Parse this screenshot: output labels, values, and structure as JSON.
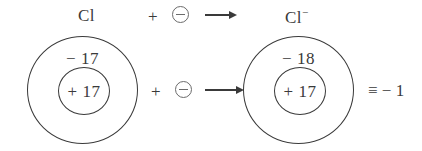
{
  "figure": {
    "background_color": "#ffffff",
    "stroke_color": "#3a3a3a",
    "electron_color": "#6b6b6b"
  },
  "equation_row": {
    "reactant_label": "Cl",
    "plus_sign": "+",
    "electron_symbol": "⊖",
    "arrow_symbol": "→",
    "product_label": "Cl",
    "product_charge": "−"
  },
  "reaction_row": {
    "plus_sign": "+",
    "electron_symbol": "⊖",
    "arrow_symbol": "→",
    "equivalence_symbol": "≡",
    "net_charge": "− 1"
  },
  "atoms": [
    {
      "name": "chlorine-atom",
      "shell_label": "− 17",
      "nucleus_label": "+ 17"
    },
    {
      "name": "chloride-ion",
      "shell_label": "− 18",
      "nucleus_label": "+ 17"
    }
  ]
}
